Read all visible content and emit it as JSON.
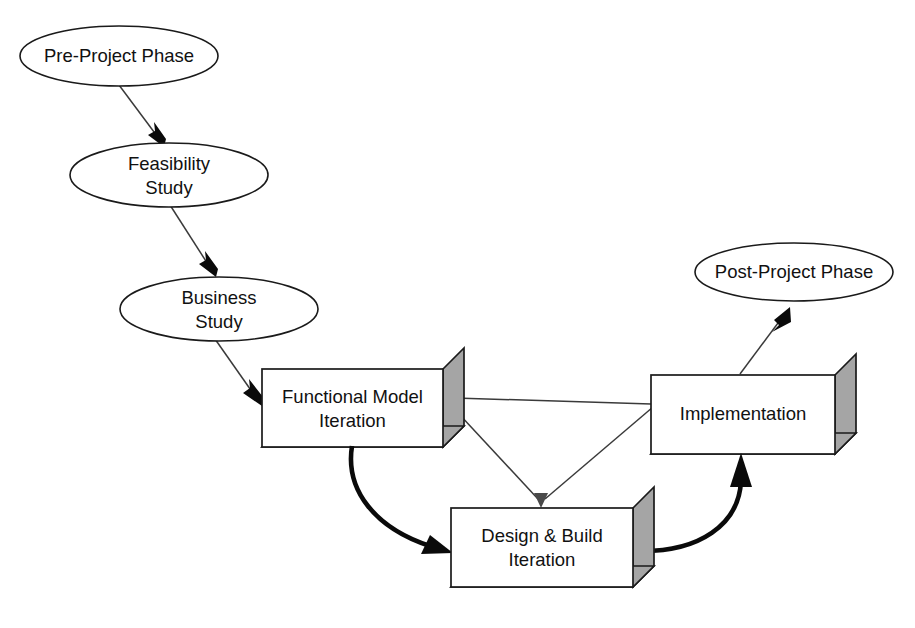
{
  "diagram": {
    "background_color": "#ffffff",
    "outline_color": "#1a1a1a",
    "box_side_color": "#a5a5a5",
    "text_color": "#111111",
    "nodes": [
      {
        "id": "pre-project-phase",
        "shape": "ellipse",
        "label": "Pre-Project Phase",
        "lines": [
          "Pre-Project Phase"
        ],
        "cx": 119,
        "cy": 56,
        "rx": 99,
        "ry": 30
      },
      {
        "id": "feasibility-study",
        "shape": "ellipse",
        "label": "Feasibility Study",
        "lines": [
          "Feasibility",
          "Study"
        ],
        "cx": 169,
        "cy": 175,
        "rx": 99,
        "ry": 32
      },
      {
        "id": "business-study",
        "shape": "ellipse",
        "label": "Business Study",
        "lines": [
          "Business",
          "Study"
        ],
        "cx": 219,
        "cy": 309,
        "rx": 99,
        "ry": 32
      },
      {
        "id": "functional-model-iteration",
        "shape": "box3d",
        "label": "Functional Model Iteration",
        "lines": [
          "Functional Model",
          "Iteration"
        ],
        "x": 262,
        "y": 369,
        "width": 181,
        "height": 78,
        "depth": 21
      },
      {
        "id": "design-and-build-iteration",
        "shape": "box3d",
        "label": "Design & Build Iteration",
        "lines": [
          "Design & Build",
          "Iteration"
        ],
        "x": 451,
        "y": 508,
        "width": 182,
        "height": 79,
        "depth": 21
      },
      {
        "id": "implementation",
        "shape": "box3d",
        "label": "Implementation",
        "lines": [
          "Implementation"
        ],
        "x": 651,
        "y": 375,
        "width": 184,
        "height": 79,
        "depth": 21
      },
      {
        "id": "post-project-phase",
        "shape": "ellipse",
        "label": "Post-Project Phase",
        "lines": [
          "Post-Project Phase"
        ],
        "cx": 794,
        "cy": 272,
        "rx": 99,
        "ry": 29
      }
    ],
    "connectors": [
      {
        "id": "pre-project-to-feasibility",
        "from": "pre-project-phase",
        "to": "feasibility-study",
        "style": "thin-straight"
      },
      {
        "id": "feasibility-to-business",
        "from": "feasibility-study",
        "to": "business-study",
        "style": "thin-straight"
      },
      {
        "id": "business-to-functional-model",
        "from": "business-study",
        "to": "functional-model-iteration",
        "style": "thin-straight"
      },
      {
        "id": "functional-model-to-design-build",
        "from": "functional-model-iteration",
        "to": "design-and-build-iteration",
        "style": "thick-curve"
      },
      {
        "id": "design-build-to-implementation",
        "from": "design-and-build-iteration",
        "to": "implementation",
        "style": "thick-curve"
      },
      {
        "id": "implementation-to-functional-model",
        "from": "implementation",
        "to": "functional-model-iteration",
        "style": "thin-straight"
      },
      {
        "id": "functional-model-to-design-build-thin",
        "from": "functional-model-iteration",
        "to": "design-and-build-iteration",
        "style": "thin-straight"
      },
      {
        "id": "implementation-to-design-build-thin",
        "from": "implementation",
        "to": "design-and-build-iteration",
        "style": "thin-straight"
      },
      {
        "id": "implementation-to-post-project",
        "from": "implementation",
        "to": "post-project-phase",
        "style": "thin-straight"
      }
    ]
  }
}
